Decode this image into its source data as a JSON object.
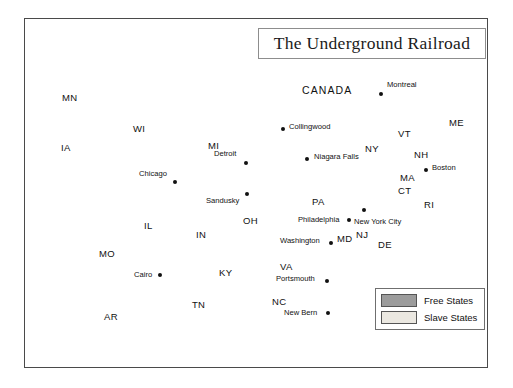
{
  "title": {
    "text": "The Underground Railroad"
  },
  "legend": {
    "items": [
      {
        "label": "Free States",
        "color": "#9c9c9c",
        "key": "free"
      },
      {
        "label": "Slave States",
        "color": "#ebe8e1",
        "key": "slave"
      }
    ]
  },
  "country_labels": [
    {
      "name": "CANADA",
      "x": 302,
      "y": 84
    }
  ],
  "state_labels": [
    {
      "code": "MN",
      "x": 62,
      "y": 92,
      "status": "free"
    },
    {
      "code": "WI",
      "x": 133,
      "y": 123,
      "status": "free"
    },
    {
      "code": "IA",
      "x": 61,
      "y": 142,
      "status": "free"
    },
    {
      "code": "MI",
      "x": 208,
      "y": 140,
      "status": "free"
    },
    {
      "code": "IL",
      "x": 144,
      "y": 220,
      "status": "free"
    },
    {
      "code": "IN",
      "x": 196,
      "y": 229,
      "status": "free"
    },
    {
      "code": "OH",
      "x": 243,
      "y": 215,
      "status": "free"
    },
    {
      "code": "PA",
      "x": 312,
      "y": 196,
      "status": "free"
    },
    {
      "code": "NY",
      "x": 365,
      "y": 143,
      "status": "free"
    },
    {
      "code": "VT",
      "x": 398,
      "y": 128,
      "status": "free"
    },
    {
      "code": "NH",
      "x": 414,
      "y": 149,
      "status": "free"
    },
    {
      "code": "ME",
      "x": 449,
      "y": 117,
      "status": "free"
    },
    {
      "code": "MA",
      "x": 400,
      "y": 172,
      "status": "free"
    },
    {
      "code": "CT",
      "x": 398,
      "y": 185,
      "status": "free"
    },
    {
      "code": "RI",
      "x": 424,
      "y": 199,
      "status": "free"
    },
    {
      "code": "NJ",
      "x": 356,
      "y": 229,
      "status": "free"
    },
    {
      "code": "DE",
      "x": 378,
      "y": 239,
      "status": "slave"
    },
    {
      "code": "MD",
      "x": 337,
      "y": 233,
      "status": "slave"
    },
    {
      "code": "MO",
      "x": 99,
      "y": 248,
      "status": "slave"
    },
    {
      "code": "KY",
      "x": 219,
      "y": 267,
      "status": "slave"
    },
    {
      "code": "VA",
      "x": 280,
      "y": 261,
      "status": "slave"
    },
    {
      "code": "AR",
      "x": 104,
      "y": 311,
      "status": "slave"
    },
    {
      "code": "TN",
      "x": 192,
      "y": 299,
      "status": "slave"
    },
    {
      "code": "NC",
      "x": 272,
      "y": 296,
      "status": "slave"
    }
  ],
  "cities": [
    {
      "name": "Montreal",
      "x": 381,
      "y": 94,
      "label_dx": 6,
      "label_dy": -9,
      "dot": true
    },
    {
      "name": "Collingwood",
      "x": 283,
      "y": 129,
      "label_dx": 6,
      "label_dy": -2,
      "dot": true
    },
    {
      "name": "Detroit",
      "x": 246,
      "y": 163,
      "label_dx": -32,
      "label_dy": -9,
      "dot": true
    },
    {
      "name": "Chicago",
      "x": 175,
      "y": 182,
      "label_dx": -36,
      "label_dy": -8,
      "dot": true
    },
    {
      "name": "Niagara Falls",
      "x": 307,
      "y": 159,
      "label_dx": 7,
      "label_dy": -2,
      "dot": true
    },
    {
      "name": "Boston",
      "x": 426,
      "y": 170,
      "label_dx": 6,
      "label_dy": -2,
      "dot": true
    },
    {
      "name": "Sandusky",
      "x": 247,
      "y": 194,
      "label_dx": -41,
      "label_dy": 7,
      "dot": true
    },
    {
      "name": "Philadelphia",
      "x": 349,
      "y": 220,
      "label_dx": -51,
      "label_dy": 0,
      "dot": true
    },
    {
      "name": "New York City",
      "x": 364,
      "y": 210,
      "label_dx": -10,
      "label_dy": 12,
      "dot": true
    },
    {
      "name": "Washington",
      "x": 331,
      "y": 243,
      "label_dx": -51,
      "label_dy": -2,
      "dot": true
    },
    {
      "name": "Cairo",
      "x": 160,
      "y": 275,
      "label_dx": -26,
      "label_dy": 0,
      "dot": true
    },
    {
      "name": "Portsmouth",
      "x": 327,
      "y": 281,
      "label_dx": -51,
      "label_dy": -2,
      "dot": true
    },
    {
      "name": "New Bern",
      "x": 328,
      "y": 313,
      "label_dx": -44,
      "label_dy": 0,
      "dot": true
    }
  ]
}
